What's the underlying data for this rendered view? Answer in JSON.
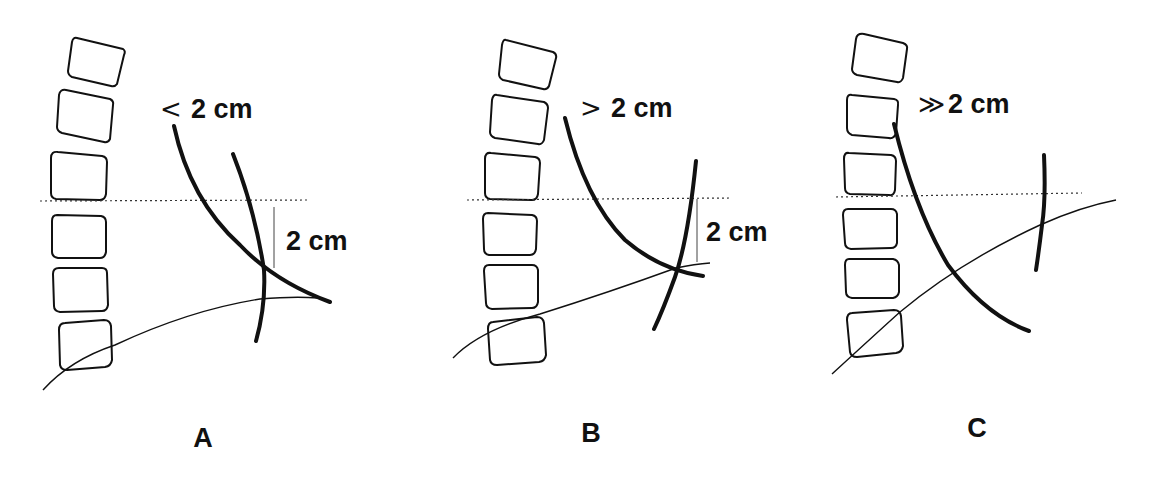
{
  "figure": {
    "panels": [
      {
        "id": "A",
        "letter": "A",
        "relation_symbol": "<",
        "top_label": "2 cm",
        "side_label": "2 cm",
        "description": "Curve apex intersection less than 2 cm below reference line"
      },
      {
        "id": "B",
        "letter": "B",
        "relation_symbol": ">",
        "top_label": "2 cm",
        "side_label": "2 cm",
        "description": "Curve intersection greater than 2 cm below reference line"
      },
      {
        "id": "C",
        "letter": "C",
        "relation_symbol": "≫",
        "top_label": "2 cm",
        "side_label": "",
        "description": "Curves do not meet near reference; much greater than 2 cm"
      }
    ],
    "colors": {
      "line": "#111111",
      "background": "#ffffff"
    }
  }
}
